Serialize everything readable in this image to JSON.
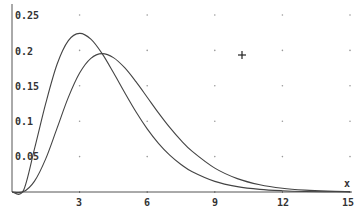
{
  "chart_data": {
    "type": "line",
    "title": "",
    "xlabel": "x",
    "ylabel": "",
    "xlim": [
      0,
      15
    ],
    "ylim": [
      0,
      0.25
    ],
    "x_ticks": [
      3,
      6,
      9,
      12,
      15
    ],
    "x_tick_labels": [
      "3",
      "6",
      "9",
      "12",
      "15"
    ],
    "y_ticks": [
      0.05,
      0.1,
      0.15,
      0.2,
      0.25
    ],
    "y_tick_labels": [
      "0.05",
      "0.1",
      "0.15",
      "0.2",
      "0.25"
    ],
    "grid": "dots",
    "legend": null,
    "x": [
      0,
      0.5,
      1,
      1.5,
      2,
      2.5,
      3,
      3.5,
      4,
      4.5,
      5,
      5.5,
      6,
      6.5,
      7,
      7.5,
      8,
      9,
      10,
      11,
      12,
      13,
      14,
      15
    ],
    "series": [
      {
        "name": "curve-1",
        "values": [
          0,
          0.0016,
          0.0613,
          0.1255,
          0.1804,
          0.2138,
          0.224,
          0.2158,
          0.1954,
          0.1687,
          0.1404,
          0.1133,
          0.0892,
          0.0688,
          0.0521,
          0.0389,
          0.0286,
          0.015,
          0.0076,
          0.0037,
          0.0018,
          0.0008,
          0.0004,
          0.0002
        ]
      },
      {
        "name": "curve-2",
        "values": [
          0,
          0.0002,
          0.0153,
          0.0471,
          0.0902,
          0.1336,
          0.168,
          0.1888,
          0.1954,
          0.1898,
          0.1755,
          0.1558,
          0.1339,
          0.1118,
          0.0912,
          0.0729,
          0.0573,
          0.0337,
          0.0189,
          0.0102,
          0.0053,
          0.0027,
          0.0013,
          0.0006
        ]
      }
    ],
    "annotations": [
      {
        "type": "cursor-cross",
        "x": 10.2,
        "y": 0.195
      }
    ]
  },
  "axes": {
    "x_label": "x",
    "x_ticks": [
      "3",
      "6",
      "9",
      "12",
      "15"
    ],
    "y_ticks": [
      "0.25",
      "0.2",
      "0.15",
      "0.1",
      "0.05"
    ]
  }
}
